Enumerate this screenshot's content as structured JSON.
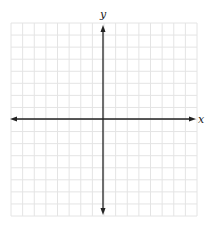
{
  "diagram": {
    "type": "coordinate-plane",
    "x_axis_label": "x",
    "y_axis_label": "y",
    "grid": {
      "columns": 16,
      "rows": 16,
      "left": 11,
      "top": 23,
      "right": 197,
      "bottom": 216,
      "color": "#e4e4e4"
    },
    "origin_px": {
      "x": 103,
      "y": 119
    },
    "axis_color": "#222222",
    "arrows": [
      "left",
      "right",
      "up",
      "down"
    ]
  }
}
